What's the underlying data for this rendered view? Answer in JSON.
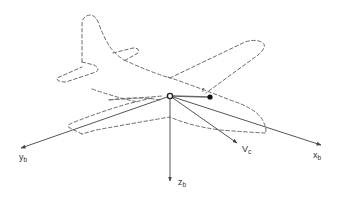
{
  "diagram": {
    "type": "aircraft body-axis coordinate system",
    "colors": {
      "outline": "#6a6a6a",
      "axes": "#555555",
      "text": "#333333",
      "background": "#ffffff"
    },
    "labels": {
      "y_axis": {
        "base": "y",
        "sub": "b"
      },
      "x_axis": {
        "base": "x",
        "sub": "b"
      },
      "z_axis": {
        "base": "z",
        "sub": "b"
      },
      "velocity": {
        "base": "V",
        "sub": "c"
      },
      "position_vector": "r"
    }
  }
}
